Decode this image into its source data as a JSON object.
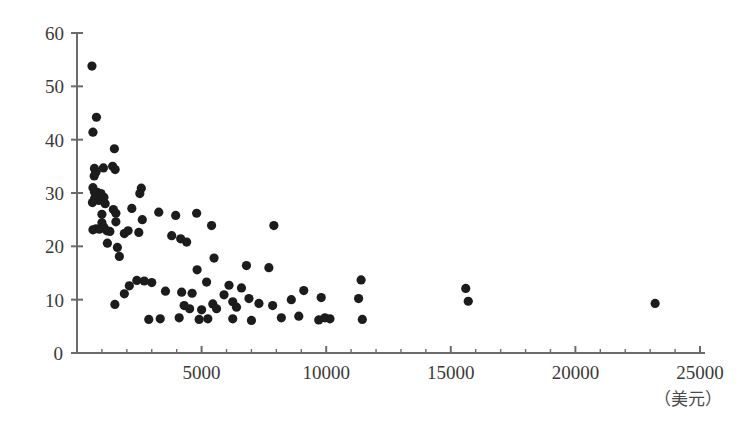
{
  "chart_data": {
    "type": "scatter",
    "title": "",
    "subtitle": "",
    "xlabel": "（美元）",
    "ylabel": "",
    "xlim": [
      0,
      25000
    ],
    "ylim": [
      0,
      60
    ],
    "grid": false,
    "legend": null,
    "x_ticks": [
      0,
      5000,
      10000,
      15000,
      20000,
      25000
    ],
    "x_tick_labels": [
      "0",
      "5000",
      "10000",
      "15000",
      "20000",
      "25000"
    ],
    "x_minor_tick_step": 1000,
    "y_ticks": [
      0,
      10,
      20,
      30,
      40,
      50,
      60
    ],
    "y_tick_labels": [
      "0",
      "10",
      "20",
      "30",
      "40",
      "50",
      "60"
    ],
    "point_color": "#1c1c1c",
    "axis_color": "#6b6b6b",
    "marker_radius": 4.6,
    "points": [
      {
        "x": 600,
        "y": 53.8
      },
      {
        "x": 780,
        "y": 44.2
      },
      {
        "x": 640,
        "y": 41.4
      },
      {
        "x": 1500,
        "y": 38.3
      },
      {
        "x": 700,
        "y": 34.6
      },
      {
        "x": 760,
        "y": 33.9
      },
      {
        "x": 690,
        "y": 33.2
      },
      {
        "x": 1430,
        "y": 35.0
      },
      {
        "x": 1530,
        "y": 34.4
      },
      {
        "x": 1060,
        "y": 34.7
      },
      {
        "x": 2580,
        "y": 30.9
      },
      {
        "x": 2520,
        "y": 29.9
      },
      {
        "x": 640,
        "y": 31.0
      },
      {
        "x": 700,
        "y": 30.2
      },
      {
        "x": 820,
        "y": 30.1
      },
      {
        "x": 960,
        "y": 29.9
      },
      {
        "x": 1080,
        "y": 29.2
      },
      {
        "x": 880,
        "y": 28.6
      },
      {
        "x": 700,
        "y": 28.9
      },
      {
        "x": 620,
        "y": 28.2
      },
      {
        "x": 1130,
        "y": 28.0
      },
      {
        "x": 2200,
        "y": 27.1
      },
      {
        "x": 3280,
        "y": 26.4
      },
      {
        "x": 1460,
        "y": 26.9
      },
      {
        "x": 1560,
        "y": 26.2
      },
      {
        "x": 1000,
        "y": 26.0
      },
      {
        "x": 3960,
        "y": 25.8
      },
      {
        "x": 2620,
        "y": 25.0
      },
      {
        "x": 1560,
        "y": 24.6
      },
      {
        "x": 1000,
        "y": 24.4
      },
      {
        "x": 4800,
        "y": 26.2
      },
      {
        "x": 5400,
        "y": 23.9
      },
      {
        "x": 7900,
        "y": 23.9
      },
      {
        "x": 640,
        "y": 23.1
      },
      {
        "x": 760,
        "y": 23.3
      },
      {
        "x": 900,
        "y": 23.2
      },
      {
        "x": 1080,
        "y": 23.6
      },
      {
        "x": 1200,
        "y": 22.9
      },
      {
        "x": 1320,
        "y": 22.8
      },
      {
        "x": 1900,
        "y": 22.4
      },
      {
        "x": 2050,
        "y": 22.9
      },
      {
        "x": 2480,
        "y": 22.6
      },
      {
        "x": 3800,
        "y": 22.0
      },
      {
        "x": 4160,
        "y": 21.4
      },
      {
        "x": 4400,
        "y": 20.8
      },
      {
        "x": 1220,
        "y": 20.6
      },
      {
        "x": 1620,
        "y": 19.8
      },
      {
        "x": 1700,
        "y": 18.1
      },
      {
        "x": 5500,
        "y": 17.8
      },
      {
        "x": 6800,
        "y": 16.4
      },
      {
        "x": 7700,
        "y": 16.0
      },
      {
        "x": 4820,
        "y": 15.6
      },
      {
        "x": 11400,
        "y": 13.7
      },
      {
        "x": 2400,
        "y": 13.6
      },
      {
        "x": 2700,
        "y": 13.5
      },
      {
        "x": 3000,
        "y": 13.2
      },
      {
        "x": 2100,
        "y": 12.6
      },
      {
        "x": 15600,
        "y": 12.1
      },
      {
        "x": 5200,
        "y": 13.3
      },
      {
        "x": 6100,
        "y": 12.7
      },
      {
        "x": 6600,
        "y": 12.2
      },
      {
        "x": 1900,
        "y": 11.1
      },
      {
        "x": 3550,
        "y": 11.6
      },
      {
        "x": 4200,
        "y": 11.4
      },
      {
        "x": 4620,
        "y": 11.2
      },
      {
        "x": 5900,
        "y": 10.9
      },
      {
        "x": 9100,
        "y": 11.7
      },
      {
        "x": 9800,
        "y": 10.4
      },
      {
        "x": 11300,
        "y": 10.2
      },
      {
        "x": 15700,
        "y": 9.7
      },
      {
        "x": 23200,
        "y": 9.3
      },
      {
        "x": 1520,
        "y": 9.1
      },
      {
        "x": 3340,
        "y": 6.4
      },
      {
        "x": 4300,
        "y": 8.9
      },
      {
        "x": 4520,
        "y": 8.3
      },
      {
        "x": 5000,
        "y": 8.1
      },
      {
        "x": 5450,
        "y": 9.2
      },
      {
        "x": 5600,
        "y": 8.3
      },
      {
        "x": 6250,
        "y": 9.6
      },
      {
        "x": 6400,
        "y": 8.6
      },
      {
        "x": 6900,
        "y": 10.2
      },
      {
        "x": 7300,
        "y": 9.3
      },
      {
        "x": 7850,
        "y": 8.9
      },
      {
        "x": 8600,
        "y": 10.0
      },
      {
        "x": 8900,
        "y": 6.9
      },
      {
        "x": 9700,
        "y": 6.2
      },
      {
        "x": 9950,
        "y": 6.6
      },
      {
        "x": 10150,
        "y": 6.4
      },
      {
        "x": 11450,
        "y": 6.3
      },
      {
        "x": 5250,
        "y": 6.4
      },
      {
        "x": 6250,
        "y": 6.4
      },
      {
        "x": 4900,
        "y": 6.3
      },
      {
        "x": 7000,
        "y": 6.1
      },
      {
        "x": 4100,
        "y": 6.6
      },
      {
        "x": 2880,
        "y": 6.3
      },
      {
        "x": 8200,
        "y": 6.6
      }
    ]
  }
}
